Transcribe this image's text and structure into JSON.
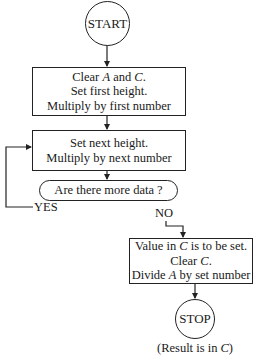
{
  "flowchart": {
    "start": {
      "label": "START"
    },
    "step1": {
      "lines": [
        {
          "pre": "Clear ",
          "var1": "A",
          "mid": " and ",
          "var2": "C",
          "post": "."
        },
        {
          "text": "Set first height."
        },
        {
          "text": "Multiply by first number"
        }
      ]
    },
    "step2": {
      "lines": [
        {
          "text": "Set next height."
        },
        {
          "text": "Multiply by next number"
        }
      ]
    },
    "decision": {
      "label": "Are there more data ?",
      "yes_label": "YES",
      "no_label": "NO"
    },
    "step3": {
      "lines": [
        {
          "pre": "Value in ",
          "var": "C",
          "post": " is to be set."
        },
        {
          "pre": "Clear ",
          "var": "C",
          "post": "."
        },
        {
          "pre": "Divide ",
          "var": "A",
          "post": " by set number"
        }
      ]
    },
    "stop": {
      "label": "STOP"
    },
    "result_note": {
      "pre": "(Result is in ",
      "var": "C",
      "post": ")"
    }
  },
  "colors": {
    "stroke": "#222222",
    "text": "#1a1a1a",
    "background": "#ffffff"
  }
}
